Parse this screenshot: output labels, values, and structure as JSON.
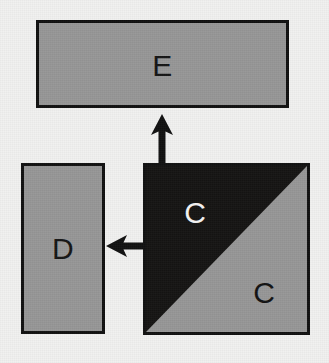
{
  "diagram": {
    "type": "block-diagram",
    "background_color": "#f1f1f0",
    "fill_color": "#969696",
    "dark_fill_color": "#141312",
    "stroke_color": "#101010",
    "nodes": [
      {
        "id": "e",
        "label": "E",
        "shape": "rectangle",
        "fill": "#969696",
        "label_color": "#141414",
        "x": 36,
        "y": 20,
        "width": 253,
        "height": 88
      },
      {
        "id": "d",
        "label": "D",
        "shape": "rectangle",
        "fill": "#969696",
        "label_color": "#141414",
        "x": 21,
        "y": 163,
        "width": 84,
        "height": 171
      },
      {
        "id": "c",
        "shape": "diagonal-split-square",
        "diagonal": "bottom-left-to-top-right",
        "upper_label": "C",
        "upper_fill": "#141312",
        "upper_label_color": "#f4f4f4",
        "lower_label": "C",
        "lower_fill": "#969696",
        "lower_label_color": "#111111",
        "x": 143,
        "y": 163,
        "width": 167,
        "height": 172
      }
    ],
    "arrows": [
      {
        "id": "c-to-e",
        "from": "c",
        "to": "e",
        "direction": "up",
        "color": "#101010"
      },
      {
        "id": "c-to-d",
        "from": "c",
        "to": "d",
        "direction": "left",
        "color": "#101010"
      }
    ]
  }
}
